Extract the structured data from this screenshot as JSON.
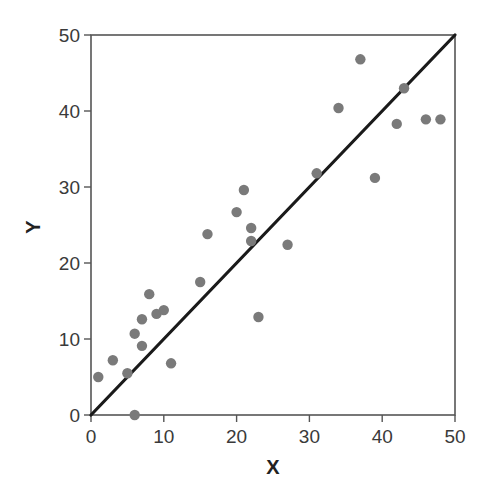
{
  "chart_data": {
    "type": "scatter",
    "title": "",
    "xlabel": "X",
    "ylabel": "Y",
    "xlim": [
      0,
      50
    ],
    "ylim": [
      0,
      50
    ],
    "xticks": [
      0,
      10,
      20,
      30,
      40,
      50
    ],
    "yticks": [
      0,
      10,
      20,
      30,
      40,
      50
    ],
    "xtick_labels": [
      "0",
      "10",
      "20",
      "30",
      "40",
      "50"
    ],
    "ytick_labels": [
      "0",
      "10",
      "20",
      "30",
      "40",
      "50"
    ],
    "grid": false,
    "legend": null,
    "series": [
      {
        "name": "points",
        "type": "scatter",
        "color": "#7a7a7a",
        "points": [
          [
            1,
            5
          ],
          [
            3,
            7.2
          ],
          [
            5,
            5.5
          ],
          [
            6,
            0
          ],
          [
            6,
            10.7
          ],
          [
            7,
            9.1
          ],
          [
            7,
            12.6
          ],
          [
            8,
            15.9
          ],
          [
            9,
            13.3
          ],
          [
            10,
            13.8
          ],
          [
            11,
            6.8
          ],
          [
            15,
            17.5
          ],
          [
            16,
            23.8
          ],
          [
            20,
            26.7
          ],
          [
            21,
            29.6
          ],
          [
            22,
            24.6
          ],
          [
            22,
            22.9
          ],
          [
            23,
            12.9
          ],
          [
            27,
            22.4
          ],
          [
            31,
            31.8
          ],
          [
            34,
            40.4
          ],
          [
            37,
            46.8
          ],
          [
            39,
            31.2
          ],
          [
            42,
            38.3
          ],
          [
            43,
            43
          ],
          [
            46,
            38.9
          ],
          [
            48,
            38.9
          ]
        ]
      },
      {
        "name": "identity line (y = x)",
        "type": "line",
        "color": "#1a1a1a",
        "points": [
          [
            0,
            0
          ],
          [
            50,
            50
          ]
        ]
      }
    ]
  },
  "colors": {
    "points": "#7a7a7a",
    "line": "#1a1a1a",
    "axis": "#555555",
    "text": "#3a3a3a"
  }
}
